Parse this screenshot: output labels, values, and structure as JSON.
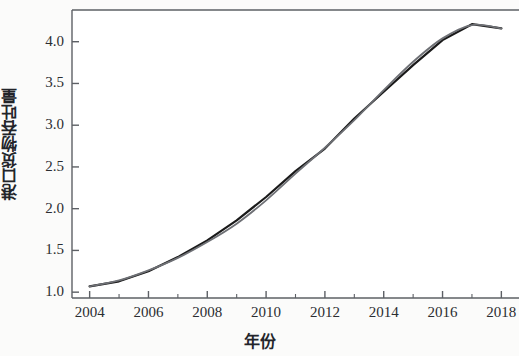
{
  "chart_data": {
    "type": "line",
    "title": "",
    "xlabel": "年份",
    "ylabel": "港口货物吞吐量",
    "xlim": [
      2003.4,
      2018.6
    ],
    "ylim": [
      0.93,
      4.38
    ],
    "xticks": [
      2004,
      2006,
      2008,
      2010,
      2012,
      2014,
      2016,
      2018
    ],
    "xtick_labels": [
      "2004",
      "2006",
      "2008",
      "2010",
      "2012",
      "2014",
      "2016",
      "2018"
    ],
    "xminorticks": [
      2005,
      2007,
      2009,
      2011,
      2013,
      2015,
      2017
    ],
    "yticks": [
      1.0,
      1.5,
      2.0,
      2.5,
      3.0,
      3.5,
      4.0
    ],
    "ytick_labels": [
      "1.0",
      "1.5",
      "2.0",
      "2.5",
      "3.0",
      "3.5",
      "4.0"
    ],
    "grid": false,
    "legend": "none",
    "x": [
      2004,
      2005,
      2006,
      2007,
      2008,
      2009,
      2010,
      2011,
      2012,
      2013,
      2014,
      2015,
      2016,
      2017,
      2018
    ],
    "series": [
      {
        "name": "实际值",
        "color": "#1a1a1a",
        "style": "solid",
        "width": 2.2,
        "values": [
          1.07,
          1.13,
          1.25,
          1.42,
          1.62,
          1.86,
          2.14,
          2.45,
          2.72,
          3.08,
          3.4,
          3.72,
          4.02,
          4.21,
          4.16
        ]
      },
      {
        "name": "拟合值",
        "color": "#6e7075",
        "style": "solid",
        "width": 1.8,
        "values": [
          1.07,
          1.14,
          1.26,
          1.41,
          1.6,
          1.82,
          2.1,
          2.42,
          2.73,
          3.06,
          3.42,
          3.76,
          4.04,
          4.2,
          4.16
        ]
      }
    ]
  }
}
